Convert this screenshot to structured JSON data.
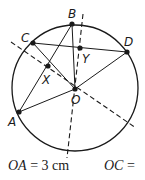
{
  "diagram": {
    "circle": {
      "cx": 75,
      "cy": 88,
      "r": 63
    },
    "points": {
      "A": {
        "label": "A",
        "x": 19,
        "y": 112
      },
      "B": {
        "label": "B",
        "x": 72,
        "y": 24
      },
      "C": {
        "label": "C",
        "x": 33,
        "y": 43
      },
      "D": {
        "label": "D",
        "x": 127,
        "y": 52
      },
      "O": {
        "label": "O",
        "x": 75,
        "y": 89
      },
      "X": {
        "label": "X",
        "x": 48,
        "y": 66
      },
      "Y": {
        "label": "Y",
        "x": 80,
        "y": 48
      }
    },
    "segments": [
      "CD",
      "BA",
      "CO",
      "BO",
      "AO",
      "DO"
    ],
    "dashed_lines": [
      {
        "name": "perpendicular-bisector-AC",
        "through": [
          "X",
          "O"
        ]
      },
      {
        "name": "perpendicular-bisector-BD",
        "through": [
          "Y",
          "O"
        ]
      }
    ],
    "colors": {
      "stroke": "#1a1a1a",
      "background": "#ffffff"
    }
  },
  "caption": {
    "oa_var": "OA",
    "oa_value": "= 3 cm",
    "oc_var": "OC",
    "oc_value": "="
  }
}
